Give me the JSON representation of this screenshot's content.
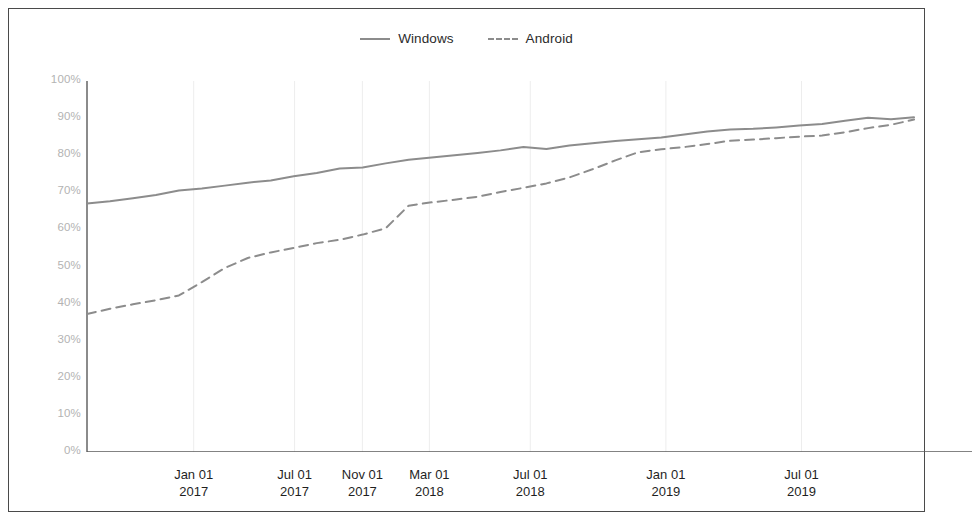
{
  "figure": {
    "background_color": "#ffffff",
    "border_color": "#4a4a4a"
  },
  "legend": {
    "position": "top-center",
    "entries": [
      {
        "label": "Windows",
        "style": "solid",
        "color": "#8c8c8c",
        "swatch_name": "legend-swatch-windows"
      },
      {
        "label": "Android",
        "style": "dashed",
        "color": "#8c8c8c",
        "swatch_name": "legend-swatch-android"
      }
    ]
  },
  "axes": {
    "y_tick_labels": [
      "100%",
      "90%",
      "80%",
      "70%",
      "60%",
      "50%",
      "40%",
      "30%",
      "20%",
      "10%",
      "0%"
    ],
    "y_label_color": "#b3b3b3",
    "x_tick_labels": [
      {
        "date": "Jan 01",
        "year": "2017"
      },
      {
        "date": "Jul 01",
        "year": "2017"
      },
      {
        "date": "Nov 01",
        "year": "2017"
      },
      {
        "date": "Mar 01",
        "year": "2018"
      },
      {
        "date": "Jul 01",
        "year": "2018"
      },
      {
        "date": "Jan 01",
        "year": "2019"
      },
      {
        "date": "Jul 01",
        "year": "2019"
      }
    ],
    "axis_line_color": "#5a5a5a",
    "gridline_color": "#ededed"
  },
  "chart_data": {
    "type": "line",
    "title": "",
    "xlabel": "",
    "ylabel": "",
    "ylim": [
      0,
      100
    ],
    "y_tick_values": [
      0,
      10,
      20,
      30,
      40,
      50,
      60,
      70,
      80,
      90,
      100
    ],
    "grid": "vertical-only",
    "legend_position": "top-center",
    "x_tick_positions_pct": [
      12.9,
      25.1,
      33.3,
      41.4,
      53.6,
      70.0,
      86.4
    ],
    "categories": [
      "Nov 01 2016",
      "Dec 01 2016",
      "Jan 01 2017",
      "Feb 01 2017",
      "Mar 01 2017",
      "Apr 01 2017",
      "May 01 2017",
      "Jun 01 2017",
      "Jul 01 2017",
      "Aug 01 2017",
      "Sep 01 2017",
      "Oct 01 2017",
      "Nov 01 2017",
      "Dec 01 2017",
      "Jan 01 2018",
      "Feb 01 2018",
      "Mar 01 2018",
      "Apr 01 2018",
      "May 01 2018",
      "Jun 01 2018",
      "Jul 01 2018",
      "Aug 01 2018",
      "Sep 01 2018",
      "Oct 01 2018",
      "Nov 01 2018",
      "Dec 01 2018",
      "Jan 01 2019",
      "Feb 01 2019",
      "Mar 01 2019",
      "Apr 01 2019",
      "May 01 2019",
      "Jun 01 2019",
      "Jul 01 2019",
      "Aug 01 2019",
      "Sep 01 2019",
      "Oct 01 2019",
      "Nov 01 2019"
    ],
    "series": [
      {
        "name": "Windows",
        "style": "solid",
        "color": "#8c8c8c",
        "values": [
          67.0,
          67.6,
          68.4,
          69.3,
          70.5,
          71.0,
          71.8,
          72.6,
          73.2,
          74.3,
          75.2,
          76.4,
          76.7,
          77.8,
          78.8,
          79.4,
          80.0,
          80.6,
          81.3,
          82.2,
          81.7,
          82.6,
          83.2,
          83.8,
          84.3,
          84.8,
          85.6,
          86.4,
          86.9,
          87.1,
          87.5,
          88.0,
          88.4,
          89.3,
          90.1,
          89.7,
          90.2
        ]
      },
      {
        "name": "Android",
        "style": "dashed",
        "color": "#8c8c8c",
        "values": [
          37.2,
          38.6,
          39.8,
          40.9,
          42.2,
          45.8,
          49.6,
          52.3,
          53.8,
          55.0,
          56.3,
          57.2,
          58.6,
          60.3,
          66.4,
          67.3,
          68.0,
          68.8,
          70.1,
          71.2,
          72.4,
          74.0,
          76.2,
          78.6,
          80.8,
          81.6,
          82.2,
          83.0,
          83.9,
          84.2,
          84.6,
          85.0,
          85.3,
          86.2,
          87.3,
          88.2,
          89.6
        ]
      }
    ]
  }
}
